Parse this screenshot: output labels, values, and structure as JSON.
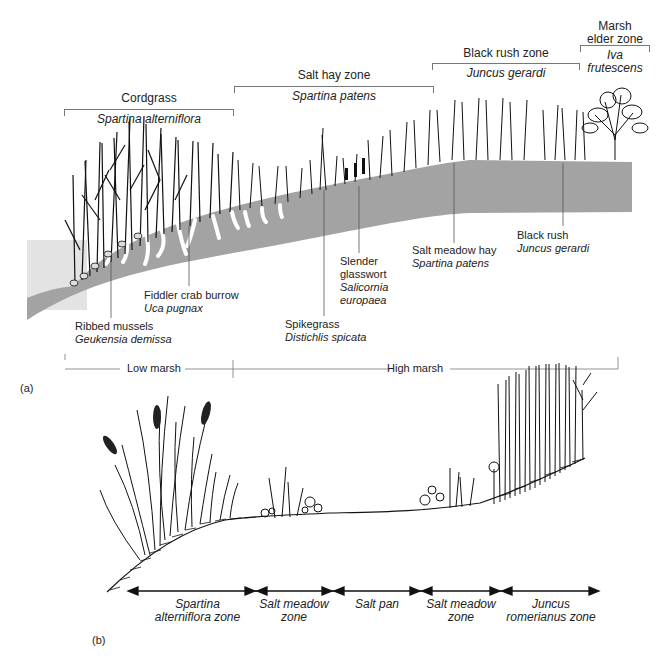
{
  "figure_a": {
    "panel_label": "(a)",
    "zones": [
      {
        "common": "Cordgrass",
        "scientific": "Spartina alterniflora"
      },
      {
        "common": "Salt hay zone",
        "scientific": "Spartina patens"
      },
      {
        "common": "Black rush zone",
        "scientific": "Juncus gerardi"
      },
      {
        "common_line1": "Marsh",
        "common_line2": "elder zone",
        "scientific_line1": "Iva",
        "scientific_line2": "frutescens"
      }
    ],
    "callouts": [
      {
        "common": "Ribbed mussels",
        "scientific": "Geukensia demissa"
      },
      {
        "common": "Fiddler crab burrow",
        "scientific": "Uca pugnax"
      },
      {
        "common": "Spikegrass",
        "scientific": "Distichlis spicata"
      },
      {
        "common_line1": "Slender",
        "common_line2": "glasswort",
        "scientific_line1": "Salicornia",
        "scientific_line2": "europaea"
      },
      {
        "common": "Salt meadow hay",
        "scientific": "Spartina patens"
      },
      {
        "common": "Black rush",
        "scientific": "Juncus gerardi"
      }
    ],
    "marsh_levels": {
      "low": "Low marsh",
      "high": "High marsh"
    },
    "colors": {
      "ground": "#a3a3a3",
      "water": "#e3e3e3",
      "plants": "#111111"
    }
  },
  "figure_b": {
    "panel_label": "(b)",
    "zones": [
      {
        "line1": "Spartina",
        "line2": "alterniflora zone"
      },
      {
        "line1": "Salt meadow",
        "line2": "zone"
      },
      {
        "line1": "Salt pan",
        "line2": ""
      },
      {
        "line1": "Salt meadow",
        "line2": "zone"
      },
      {
        "line1": "Juncus",
        "line2": "romerianus zone"
      }
    ]
  }
}
